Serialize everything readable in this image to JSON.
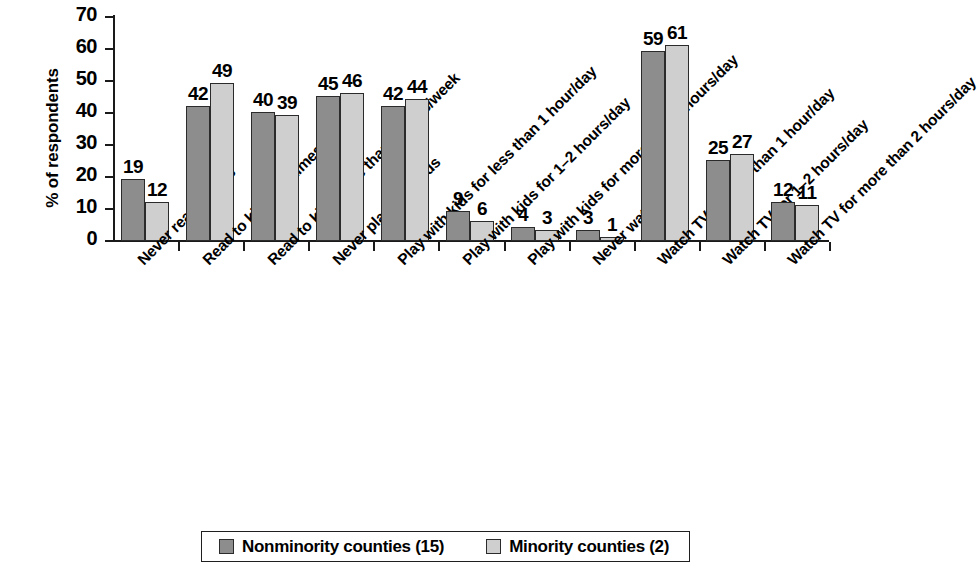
{
  "chart_data": {
    "type": "bar",
    "title": "",
    "subtitle": "",
    "xlabel": "",
    "ylabel": "% of respondents",
    "ylim": [
      0,
      70
    ],
    "ytick_values": [
      0,
      10,
      20,
      30,
      40,
      50,
      60,
      70
    ],
    "ytick_labels": [
      "0",
      "10",
      "20",
      "30",
      "40",
      "50",
      "60",
      "70"
    ],
    "grid": false,
    "legend_position": "bottom",
    "categories": [
      "Never read to kids",
      "Read to kids 1–2 times/week",
      "Read to kids more than 2 times/week",
      "Never play with kids",
      "Play with kids for less than 1 hour/day",
      "Play with kids for 1–2 hours/day",
      "Play with kids for more than 2 hours/day",
      "Never watch TV",
      "Watch TV for less than 1 hour/day",
      "Watch TV for 1–2 hours/day",
      "Watch TV for more than 2 hours/day"
    ],
    "series": [
      {
        "name": "Nonminority counties (15)",
        "color": "#8d8d8d",
        "values": [
          19,
          42,
          40,
          45,
          42,
          9,
          4,
          3,
          59,
          25,
          12
        ]
      },
      {
        "name": "Minority counties (2)",
        "color": "#cfcfcf",
        "values": [
          12,
          49,
          39,
          46,
          44,
          6,
          3,
          1,
          61,
          27,
          11
        ]
      }
    ]
  },
  "legend": {
    "entries": [
      {
        "label": "Nonminority counties (15)",
        "swatch": "#8d8d8d"
      },
      {
        "label": "Minority counties (2)",
        "swatch": "#cfcfcf"
      }
    ]
  }
}
